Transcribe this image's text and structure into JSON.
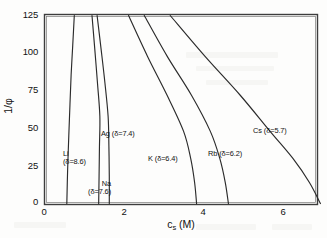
{
  "chart_data": {
    "type": "line",
    "title": "",
    "xlabel": "c_s (M)",
    "ylabel": "1/φ",
    "xlim": [
      0,
      6.9
    ],
    "ylim": [
      0,
      125
    ],
    "xticks": [
      "0",
      "2",
      "4",
      "6"
    ],
    "xtick_values": [
      0,
      2,
      4,
      6
    ],
    "yticks": [
      "0",
      "25",
      "50",
      "75",
      "100",
      "125"
    ],
    "ytick_values": [
      0,
      25,
      50,
      75,
      100,
      125
    ],
    "grid": false,
    "legend": "inline-annotations",
    "line_color": "#2b2b2b",
    "frame_color": "#3a3a3a",
    "background": "#fdfdfc",
    "series": [
      {
        "name": "Li",
        "delta": "8.6",
        "label": "Li",
        "label_line2": "(δ=8.6)",
        "x": [
          0.55,
          0.57,
          0.6,
          0.63,
          0.66,
          0.7,
          0.74
        ],
        "y": [
          0,
          22,
          45,
          66,
          86,
          105,
          125
        ]
      },
      {
        "name": "Na",
        "delta": "7.6",
        "label": "Na",
        "label_line2": "(δ=7.6)",
        "x": [
          1.36,
          1.37,
          1.38,
          1.39,
          1.33,
          1.26,
          1.19
        ],
        "y": [
          0,
          18,
          38,
          58,
          80,
          103,
          125
        ]
      },
      {
        "name": "Ag",
        "delta": "7.4",
        "label": "Ag (δ=7.4)",
        "label_line2": "",
        "x": [
          1.63,
          1.63,
          1.62,
          1.6,
          1.52,
          1.42,
          1.32
        ],
        "y": [
          0,
          18,
          38,
          58,
          80,
          103,
          125
        ]
      },
      {
        "name": "K",
        "delta": "6.4",
        "label": "K (δ=6.4)",
        "label_line2": "",
        "x": [
          3.85,
          3.8,
          3.7,
          3.52,
          3.1,
          2.6,
          2.12
        ],
        "y": [
          0,
          14,
          30,
          48,
          72,
          98,
          125
        ]
      },
      {
        "name": "Rb",
        "delta": "6.2",
        "label": "Rb (δ=6.2)",
        "label_line2": "",
        "x": [
          4.66,
          4.58,
          4.44,
          4.2,
          3.72,
          3.1,
          2.52
        ],
        "y": [
          0,
          14,
          30,
          48,
          72,
          98,
          125
        ]
      },
      {
        "name": "Cs",
        "delta": "5.7",
        "label": "Cs (δ=5.7)",
        "label_line2": "",
        "x": [
          7.0,
          6.72,
          6.3,
          5.72,
          4.96,
          4.06,
          3.18
        ],
        "y": [
          0,
          14,
          30,
          48,
          72,
          98,
          125
        ]
      }
    ]
  },
  "axes": {
    "y_label_prefix": "1/",
    "y_label_symbol": "φ",
    "x_label_main": "c",
    "x_label_sub": "s",
    "x_label_unit": "(M)"
  }
}
